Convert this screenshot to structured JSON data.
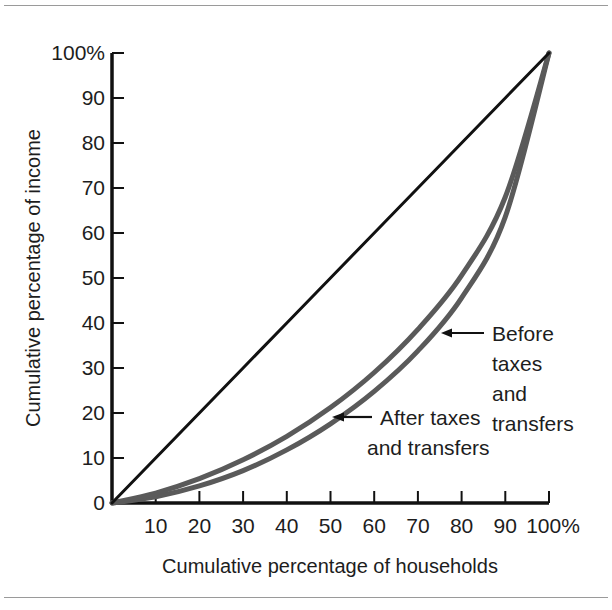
{
  "figure": {
    "background": "#ffffff",
    "rule_color": "#9a9a9a"
  },
  "chart_data": {
    "type": "line",
    "title": "",
    "subtitle": "",
    "xlabel": "Cumulative percentage of households",
    "ylabel": "Cumulative percentage of income",
    "xlim": [
      0,
      100
    ],
    "ylim": [
      0,
      100
    ],
    "grid": false,
    "legend_position": "inline-annotations",
    "x_ticks": [
      "0",
      "10",
      "20",
      "30",
      "40",
      "50",
      "60",
      "70",
      "80",
      "90",
      "100%"
    ],
    "x_tick_values": [
      0,
      10,
      20,
      30,
      40,
      50,
      60,
      70,
      80,
      90,
      100
    ],
    "y_ticks": [
      "0",
      "10",
      "20",
      "30",
      "40",
      "50",
      "60",
      "70",
      "80",
      "90",
      "100%"
    ],
    "y_tick_values": [
      0,
      10,
      20,
      30,
      40,
      50,
      60,
      70,
      80,
      90,
      100
    ],
    "x": [
      0,
      10,
      20,
      30,
      40,
      50,
      60,
      70,
      80,
      90,
      100
    ],
    "series": [
      {
        "name": "Line of equality",
        "color": "#111111",
        "width": 3,
        "values": [
          0,
          10,
          20,
          30,
          40,
          50,
          60,
          70,
          80,
          90,
          100
        ]
      },
      {
        "name": "After taxes and transfers",
        "color": "#5a5a5a",
        "width": 5,
        "values": [
          0,
          2.2,
          5.4,
          9.6,
          14.8,
          21.2,
          29.0,
          38.6,
          50.6,
          68.0,
          100
        ]
      },
      {
        "name": "Before taxes and transfers",
        "color": "#5a5a5a",
        "width": 5,
        "values": [
          0,
          1.4,
          3.8,
          7.2,
          11.8,
          17.6,
          24.8,
          33.8,
          45.6,
          63.6,
          100
        ]
      }
    ],
    "annotations": [
      {
        "id": "before-annotation",
        "lines": [
          "Before",
          "taxes",
          "and",
          "transfers"
        ],
        "text": "Before taxes and transfers",
        "target_x": 76,
        "target_y": 43,
        "arrow": "left"
      },
      {
        "id": "after-annotation",
        "lines": [
          "After taxes",
          "and transfers"
        ],
        "text": "After taxes and transfers",
        "target_x": 50,
        "target_y": 20,
        "arrow": "left"
      }
    ]
  }
}
